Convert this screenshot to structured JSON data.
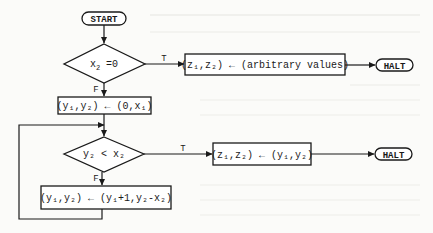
{
  "diagram": {
    "type": "flowchart",
    "colors": {
      "ink": "#1a1a1a",
      "paper": "#fbfbf9"
    },
    "nodes": {
      "start": {
        "kind": "terminal",
        "label": "START"
      },
      "test_x2": {
        "kind": "decision",
        "label_main": "x",
        "label_sub": "2",
        "label_rest": " =0"
      },
      "init": {
        "kind": "process",
        "label": "(y₁,y₂) ← (0,x₁)"
      },
      "arbitrary": {
        "kind": "process",
        "label": "(z₁,z₂) ← (arbitrary values)"
      },
      "halt1": {
        "kind": "terminal",
        "label": "HALT"
      },
      "test_y2": {
        "kind": "decision",
        "label": "y₂ < x₂"
      },
      "assign": {
        "kind": "process",
        "label": "(z₁,z₂) ← (y₁,y₂)"
      },
      "halt2": {
        "kind": "terminal",
        "label": "HALT"
      },
      "update": {
        "kind": "process",
        "label": "(y₁,y₂) ← (y₁+1,y₂-x₂)"
      }
    },
    "edges": [
      {
        "from": "start",
        "to": "test_x2",
        "label": ""
      },
      {
        "from": "test_x2",
        "to": "arbitrary",
        "label": "T"
      },
      {
        "from": "arbitrary",
        "to": "halt1",
        "label": ""
      },
      {
        "from": "test_x2",
        "to": "init",
        "label": "F"
      },
      {
        "from": "init",
        "to": "test_y2",
        "label": ""
      },
      {
        "from": "test_y2",
        "to": "assign",
        "label": "T"
      },
      {
        "from": "assign",
        "to": "halt2",
        "label": ""
      },
      {
        "from": "test_y2",
        "to": "update",
        "label": "F"
      },
      {
        "from": "update",
        "to": "test_y2",
        "label": ""
      }
    ],
    "edge_labels": {
      "t1": "T",
      "f1": "F",
      "t2": "T",
      "f2": "F"
    }
  }
}
